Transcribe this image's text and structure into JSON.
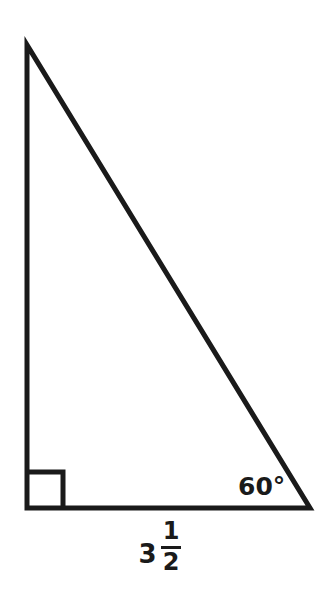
{
  "figure": {
    "background_color": "#ffffff",
    "stroke_color": "#1a1a1a",
    "stroke_width": 5
  },
  "triangle": {
    "vertices": {
      "apex": {
        "x": 27,
        "y": 45
      },
      "bottom_left": {
        "x": 27,
        "y": 508
      },
      "bottom_right": {
        "x": 310,
        "y": 508
      }
    },
    "right_angle_marker": {
      "corner": "bottom-left",
      "size": 36
    }
  },
  "labels": {
    "angle": {
      "value": "60",
      "degree_symbol": "°",
      "text": "60°",
      "position": "inside bottom-right vertex"
    },
    "base_length": {
      "whole": "3",
      "numerator": "1",
      "denominator": "2",
      "text": "3 1/2",
      "position": "below base"
    }
  },
  "chart_data": {
    "type": "diagram",
    "shape": "right-triangle",
    "known_values": {
      "acute_angle_degrees": 60,
      "right_angle_degrees": 90,
      "base_length": 3.5,
      "base_length_display": "3 1/2"
    },
    "annotations": [
      "60°",
      "3 1/2",
      "right angle square"
    ]
  }
}
